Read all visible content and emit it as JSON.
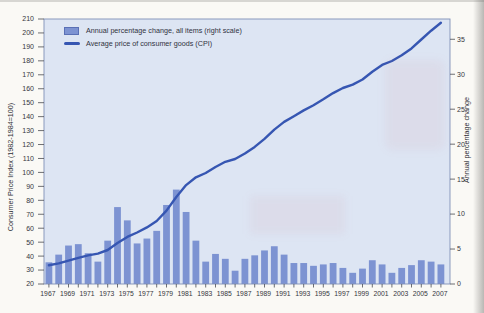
{
  "legend": {
    "items": [
      {
        "swatch": "bar",
        "label": "Annual percentage change, all items (right scale)"
      },
      {
        "swatch": "line",
        "label": "Average price of consumer goods (CPI)"
      }
    ]
  },
  "axes": {
    "left": {
      "title": "Consumer Price Index (1982-1984=100)",
      "min": 20,
      "max": 210,
      "step": 10
    },
    "right": {
      "title": "Annual percentage change",
      "min": 0,
      "max": 35,
      "step": 5,
      "value_at_top": 37.9
    },
    "x": {
      "first_year": 1967,
      "last_year": 2007,
      "label_step": 2
    }
  },
  "chart_data": {
    "type": "bar",
    "title": "",
    "xlabel": "",
    "ylabel_left": "Consumer Price Index (1982-1984=100)",
    "ylabel_right": "Annual percentage change",
    "ylim_left": [
      20,
      210
    ],
    "ylim_right": [
      0,
      37.9
    ],
    "grid": false,
    "legend_position": "top-left inside plot",
    "x": [
      1967,
      1968,
      1969,
      1970,
      1971,
      1972,
      1973,
      1974,
      1975,
      1976,
      1977,
      1978,
      1979,
      1980,
      1981,
      1982,
      1983,
      1984,
      1985,
      1986,
      1987,
      1988,
      1989,
      1990,
      1991,
      1992,
      1993,
      1994,
      1995,
      1996,
      1997,
      1998,
      1999,
      2000,
      2001,
      2002,
      2003,
      2004,
      2005,
      2006,
      2007
    ],
    "series": [
      {
        "name": "Annual percentage change, all items (right scale)",
        "type": "bar",
        "axis": "right",
        "values": [
          3.1,
          4.2,
          5.5,
          5.7,
          4.4,
          3.2,
          6.2,
          11.0,
          9.1,
          5.8,
          6.5,
          7.6,
          11.3,
          13.5,
          10.3,
          6.2,
          3.2,
          4.3,
          3.6,
          1.9,
          3.6,
          4.1,
          4.8,
          5.4,
          4.2,
          3.0,
          3.0,
          2.6,
          2.8,
          3.0,
          2.3,
          1.6,
          2.2,
          3.4,
          2.8,
          1.6,
          2.3,
          2.7,
          3.4,
          3.2,
          2.8
        ]
      },
      {
        "name": "Average price of consumer goods (CPI)",
        "type": "line",
        "axis": "left",
        "values": [
          33.4,
          34.8,
          36.7,
          38.8,
          40.5,
          41.8,
          44.4,
          49.3,
          53.8,
          56.9,
          60.6,
          65.2,
          72.6,
          82.4,
          90.9,
          96.5,
          99.6,
          103.9,
          107.6,
          109.6,
          113.6,
          118.3,
          124.0,
          130.7,
          136.2,
          140.3,
          144.5,
          148.2,
          152.4,
          156.9,
          160.5,
          163.0,
          166.6,
          172.2,
          177.1,
          179.9,
          184.0,
          188.9,
          195.3,
          201.6,
          207.3
        ]
      }
    ]
  },
  "colors": {
    "plot_background": "#dde5f3",
    "plot_border": "#8090b8",
    "bar_fill": "#7d93d2",
    "line_stroke": "#3656b2",
    "tick_text": "#35363c",
    "page_background": "#faf9f5"
  }
}
